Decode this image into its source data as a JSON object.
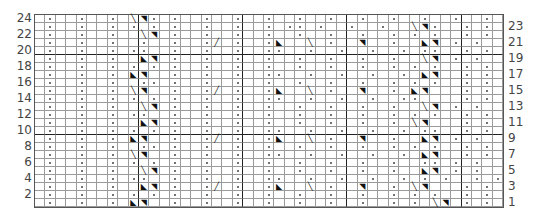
{
  "chart": {
    "type": "knitting-chart",
    "columns": 45,
    "rows_count": 24,
    "thick_cols_after": [
      10,
      20,
      30,
      41
    ],
    "thick_rows_below": [
      20,
      10
    ],
    "legend_symbols": {
      ".": "knit (empty)",
      "o": "purl (dot)",
      "L": "left cross \\",
      "R": "right cross /",
      "a": "twist left ◣",
      "b": "twist right ◥"
    },
    "rows": [
      {
        "n": 24,
        "cells": ".o..o..o.Lbo.o..o..o..o..o..o..o..o..o..o..o."
      },
      {
        "n": 23,
        "cells": ".o..o..o.o.o.o..o..o..o.oo.o..o..o..Lbo..o.o."
      },
      {
        "n": 22,
        "cells": ".o..o..o..Lb.o..o..o..o..o..o..o..o.o.o..o.o."
      },
      {
        "n": 21,
        "cells": ".o..o..o..o..o..oR.o..oa..L.o..b..o..ab.o.o."
      },
      {
        "n": 20,
        "cells": ".o..o..o.oo..o..o..o..oo..o..o..o..o.oo..o.o."
      },
      {
        "n": 19,
        "cells": ".o..o..o..ab.o..o..o..o..o..o..o..o..Lb.o.o."
      },
      {
        "n": 18,
        "cells": ".o..o..o.o.o.o..o..o..o..o..o..o..o.o.o..o.o."
      },
      {
        "n": 17,
        "cells": ".o..o..o.ab..o..o..o..oo..o..o..o..o.ab..o.o."
      },
      {
        "n": 16,
        "cells": ".o..o..o..oo.o..o..o..o..o..o..o..o.o.o..o.o."
      },
      {
        "n": 15,
        "cells": ".o..o..o.Lb..o..oR.o..oa..L.o..b..o.ab...o.o."
      },
      {
        "n": 14,
        "cells": ".o..o..o.o.o.o..o..o..oo..o..o..o..oo....o.o."
      },
      {
        "n": 13,
        "cells": ".o..o..o..Lb.o..o..o..o..o..o..o..o..Lb.o.o."
      },
      {
        "n": 12,
        "cells": ".o..o..o.oo..o..o..o..o..o..o..o..o.o.o..o.o."
      },
      {
        "n": 11,
        "cells": ".o..o..o..ab.o..o..o..o..o..o..o..o.Lb...o.o."
      },
      {
        "n": 10,
        "cells": ".o..o..o.o.o.o..o..o..oo..o..o..o..o.oo..o.o."
      },
      {
        "n": 9,
        "cells": ".o..o..o.ab..o..oR.o..oa..L.o..b..o..ab.o.o."
      },
      {
        "n": 8,
        "cells": ".o..o..o..oo.o..o..o..o..o..o..o..o.o.o..o.o."
      },
      {
        "n": 7,
        "cells": ".o..o..o.Lb..o..o..o..oo..o..o..o..o.ab..o.o."
      },
      {
        "n": 6,
        "cells": ".o..o..o.o.o.o..o..o..o..o..o..o..o..oo.o.o."
      },
      {
        "n": 5,
        "cells": ".o..o..o..Lb.o..o..o..o..o..o..o..o..ab.o.o."
      },
      {
        "n": 4,
        "cells": ".o..o..o.oo..o..o..o..oo..o..o..o..o.o.o..o.o."
      },
      {
        "n": 3,
        "cells": ".o..o..o..ab.o..oR.o..oa..L.o..b..o.Lb...o.o."
      },
      {
        "n": 2,
        "cells": ".o..o..o.o.o.o..o..o..o..o..o..o..o.o.o..o.o."
      },
      {
        "n": 1,
        "cells": ".o..o..o.ab..o..o..o..o..o..o..o..o.o.Lb.o.o."
      }
    ],
    "left_labels": [
      "24",
      "22",
      "20",
      "18",
      "16",
      "14",
      "12",
      "10",
      "8",
      "6",
      "4",
      "2"
    ],
    "right_labels": [
      "23",
      "21",
      "19",
      "17",
      "15",
      "13",
      "11",
      "9",
      "7",
      "5",
      "3",
      "1"
    ]
  }
}
